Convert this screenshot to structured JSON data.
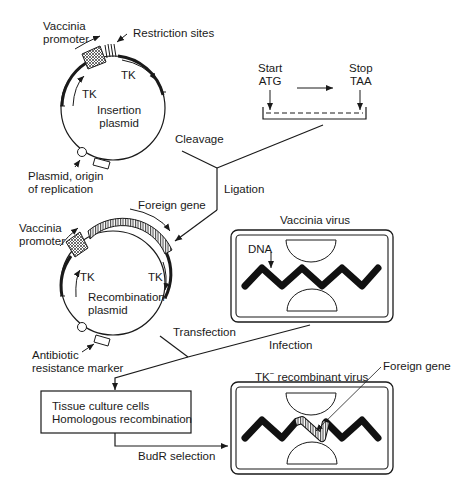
{
  "insertion_plasmid": {
    "title_line1": "Insertion",
    "title_line2": "plasmid",
    "promoter_line1": "Vaccinia",
    "promoter_line2": "promoter",
    "restriction_sites": "Restriction sites",
    "tk_left": "TK",
    "tk_right": "TK",
    "origin_line1": "Plasmid, origin",
    "origin_line2": "of replication"
  },
  "gene_construct": {
    "start_line1": "Start",
    "start_line2": "ATG",
    "stop_line1": "Stop",
    "stop_line2": "TAA"
  },
  "steps": {
    "cleavage": "Cleavage",
    "ligation": "Ligation",
    "transfection": "Transfection",
    "infection": "Infection",
    "budr_selection": "BudR selection"
  },
  "recombination_plasmid": {
    "title_line1": "Recombination",
    "title_line2": "plasmid",
    "promoter_line1": "Vaccinia",
    "promoter_line2": "promoter",
    "foreign_gene": "Foreign gene",
    "tk_left": "TK",
    "tk_right": "TK",
    "marker_line1": "Antibiotic",
    "marker_line2": "resistance marker"
  },
  "vaccinia_virus": {
    "title": "Vaccinia virus",
    "dna_label": "DNA"
  },
  "tissue_culture": {
    "line1": "Tissue culture cells",
    "line2": "Homologous recombination"
  },
  "recombinant_virus": {
    "title_prefix": "TK",
    "title_sup": "−",
    "title_suffix": " recombinant virus",
    "foreign_gene": "Foreign gene"
  }
}
